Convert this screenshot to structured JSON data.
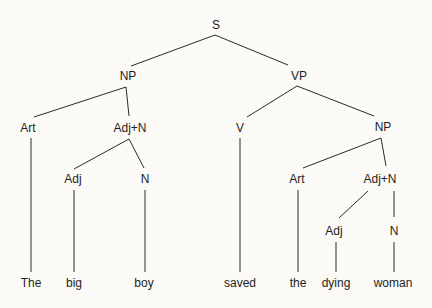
{
  "diagram": {
    "type": "syntax-tree",
    "nodes": {
      "S": "S",
      "NP1": "NP",
      "VP": "VP",
      "Art1": "Art",
      "AdjN1": "Adj+N",
      "Adj1": "Adj",
      "N1": "N",
      "V": "V",
      "NP2": "NP",
      "Art2": "Art",
      "AdjN2": "Adj+N",
      "Adj2": "Adj",
      "N2": "N"
    },
    "words": [
      "The",
      "big",
      "boy",
      "saved",
      "the",
      "dying",
      "woman"
    ],
    "edges": [
      [
        "S",
        "NP1"
      ],
      [
        "S",
        "VP"
      ],
      [
        "NP1",
        "Art1"
      ],
      [
        "NP1",
        "AdjN1"
      ],
      [
        "AdjN1",
        "Adj1"
      ],
      [
        "AdjN1",
        "N1"
      ],
      [
        "VP",
        "V"
      ],
      [
        "VP",
        "NP2"
      ],
      [
        "NP2",
        "Art2"
      ],
      [
        "NP2",
        "AdjN2"
      ],
      [
        "AdjN2",
        "Adj2"
      ],
      [
        "AdjN2",
        "N2"
      ],
      [
        "Art1",
        "The"
      ],
      [
        "Adj1",
        "big"
      ],
      [
        "N1",
        "boy"
      ],
      [
        "V",
        "saved"
      ],
      [
        "Art2",
        "the"
      ],
      [
        "Adj2",
        "dying"
      ],
      [
        "N2",
        "woman"
      ]
    ]
  }
}
